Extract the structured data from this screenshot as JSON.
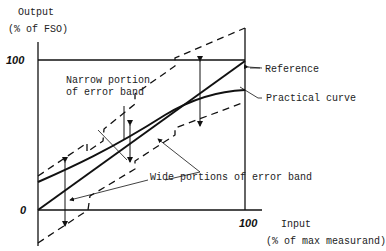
{
  "diagram": {
    "y_axis": {
      "label_line1": "Output",
      "label_line2": "(% of FSO)",
      "tick_top": "100",
      "tick_origin": "0"
    },
    "x_axis": {
      "label_line1": "Input",
      "label_line2": "(% of max measurand)",
      "tick_right": "100"
    },
    "annotations": {
      "reference": "Reference",
      "practical_curve": "Practical curve",
      "narrow_line1": "Narrow portion",
      "narrow_line2": "of error  band",
      "wide": "Wide portions  of error band"
    },
    "colors": {
      "line": "#111111",
      "text": "#222222",
      "background": "#ffffff"
    }
  }
}
